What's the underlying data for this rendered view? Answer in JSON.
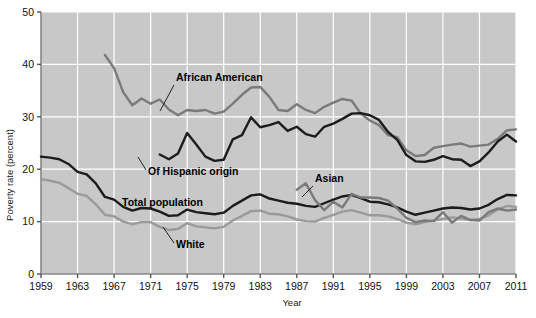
{
  "chart_data": {
    "type": "line",
    "title": "",
    "xlabel": "Year",
    "ylabel": "Poverty rate (percent)",
    "xlim": [
      1959,
      2011
    ],
    "ylim": [
      0,
      50
    ],
    "yticks": [
      0,
      10,
      20,
      30,
      40,
      50
    ],
    "xticks": [
      1959,
      1963,
      1967,
      1971,
      1975,
      1979,
      1983,
      1987,
      1991,
      1995,
      1999,
      2003,
      2007,
      2011
    ],
    "grid": true,
    "legend": "inline-annotations",
    "plot_background": "#c8c8c8",
    "gridline_color": "#ffffff",
    "x": [
      1959,
      1960,
      1961,
      1962,
      1963,
      1964,
      1965,
      1966,
      1967,
      1968,
      1969,
      1970,
      1971,
      1972,
      1973,
      1974,
      1975,
      1976,
      1977,
      1978,
      1979,
      1980,
      1981,
      1982,
      1983,
      1984,
      1985,
      1986,
      1987,
      1988,
      1989,
      1990,
      1991,
      1992,
      1993,
      1994,
      1995,
      1996,
      1997,
      1998,
      1999,
      2000,
      2001,
      2002,
      2003,
      2004,
      2005,
      2006,
      2007,
      2008,
      2009,
      2010,
      2011
    ],
    "series": [
      {
        "name": "African American",
        "color": "#7a7a7a",
        "label_position": {
          "x": 176,
          "y": 81
        },
        "leader_line": {
          "x1": 174,
          "y1": 85,
          "x2": 160,
          "y2": 111
        },
        "x_start": 1966,
        "values": [
          null,
          null,
          null,
          null,
          null,
          null,
          null,
          41.8,
          39.3,
          34.7,
          32.2,
          33.5,
          32.5,
          33.3,
          31.4,
          30.3,
          31.3,
          31.1,
          31.3,
          30.6,
          31.0,
          32.5,
          34.2,
          35.6,
          35.7,
          33.8,
          31.3,
          31.1,
          32.4,
          31.3,
          30.7,
          31.9,
          32.7,
          33.4,
          33.1,
          30.6,
          29.3,
          28.4,
          26.5,
          26.1,
          23.6,
          22.5,
          22.7,
          24.1,
          24.4,
          24.7,
          24.9,
          24.3,
          24.5,
          24.7,
          25.8,
          27.4,
          27.6
        ]
      },
      {
        "name": "Of Hispanic origin",
        "color": "#1c1c1c",
        "label_position": {
          "x": 148,
          "y": 175
        },
        "leader_line": {
          "x1": 146,
          "y1": 170,
          "x2": 138,
          "y2": 157
        },
        "x_start": 1972,
        "values": [
          null,
          null,
          null,
          null,
          null,
          null,
          null,
          null,
          null,
          null,
          null,
          null,
          null,
          22.8,
          21.9,
          23.0,
          26.9,
          24.7,
          22.4,
          21.6,
          21.8,
          25.7,
          26.5,
          29.9,
          28.0,
          28.4,
          29.0,
          27.3,
          28.1,
          26.7,
          26.2,
          28.1,
          28.7,
          29.6,
          30.6,
          30.7,
          30.3,
          29.4,
          27.1,
          25.6,
          22.7,
          21.5,
          21.4,
          21.8,
          22.5,
          21.9,
          21.8,
          20.6,
          21.5,
          23.2,
          25.3,
          26.6,
          25.3
        ]
      },
      {
        "name": "Total population",
        "color": "#1c1c1c",
        "label_position": {
          "x": 122,
          "y": 206
        },
        "leader_line": null,
        "x_start": 1959,
        "values": [
          22.4,
          22.2,
          21.9,
          21.0,
          19.5,
          19.0,
          17.3,
          14.7,
          14.2,
          12.8,
          12.1,
          12.6,
          12.5,
          11.9,
          11.1,
          11.2,
          12.3,
          11.8,
          11.6,
          11.4,
          11.7,
          13.0,
          14.0,
          15.0,
          15.2,
          14.4,
          14.0,
          13.6,
          13.4,
          13.0,
          12.8,
          13.5,
          14.2,
          14.8,
          15.1,
          14.5,
          13.8,
          13.7,
          13.3,
          12.7,
          11.9,
          11.3,
          11.7,
          12.1,
          12.5,
          12.7,
          12.6,
          12.3,
          12.5,
          13.2,
          14.3,
          15.1,
          15.0
        ]
      },
      {
        "name": "White",
        "color": "#9a9a9a",
        "label_position": {
          "x": 176,
          "y": 248
        },
        "leader_line": {
          "x1": 174,
          "y1": 243,
          "x2": 163,
          "y2": 227
        },
        "x_start": 1959,
        "values": [
          18.1,
          17.8,
          17.4,
          16.4,
          15.3,
          14.9,
          13.3,
          11.3,
          11.0,
          10.0,
          9.5,
          9.9,
          9.9,
          9.0,
          8.4,
          8.6,
          9.7,
          9.1,
          8.9,
          8.7,
          9.0,
          10.2,
          11.1,
          12.0,
          12.1,
          11.5,
          11.4,
          11.0,
          10.4,
          10.1,
          10.0,
          10.7,
          11.3,
          11.9,
          12.2,
          11.7,
          11.2,
          11.2,
          11.0,
          10.5,
          9.8,
          9.5,
          9.9,
          10.2,
          10.5,
          10.8,
          10.6,
          10.3,
          10.5,
          11.2,
          12.3,
          13.0,
          12.8
        ]
      },
      {
        "name": "Asian",
        "color": "#7a7a7a",
        "label_position": {
          "x": 315,
          "y": 182
        },
        "leader_line": {
          "x1": 313,
          "y1": 186,
          "x2": 302,
          "y2": 197
        },
        "x_start": 1987,
        "values": [
          null,
          null,
          null,
          null,
          null,
          null,
          null,
          null,
          null,
          null,
          null,
          null,
          null,
          null,
          null,
          null,
          null,
          null,
          null,
          null,
          null,
          null,
          null,
          null,
          null,
          null,
          null,
          null,
          16.1,
          17.3,
          14.1,
          12.2,
          13.8,
          12.7,
          15.3,
          14.6,
          14.6,
          14.5,
          14.0,
          12.5,
          10.7,
          9.9,
          10.2,
          10.1,
          11.8,
          9.8,
          11.1,
          10.3,
          10.2,
          11.8,
          12.5,
          12.1,
          12.3
        ]
      }
    ]
  }
}
